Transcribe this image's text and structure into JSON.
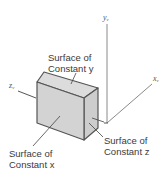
{
  "figure": {
    "axes": {
      "y": {
        "letter": "y",
        "sub": "v"
      },
      "x": {
        "letter": "x",
        "sub": "v"
      },
      "z": {
        "letter": "z",
        "sub": "v"
      }
    },
    "labels": {
      "constant_y": {
        "line1": "Surface of",
        "line2": "Constant y"
      },
      "constant_x": {
        "line1": "Surface of",
        "line2": "Constant x"
      },
      "constant_z": {
        "line1": "Surface of",
        "line2": "Constant z"
      }
    },
    "colors": {
      "box_front": "#d4d4d4",
      "box_top": "#dcdcdc",
      "box_side": "#cfcfcf",
      "edge": "#555555",
      "axis": "#777777",
      "text": "#3a3a3a"
    }
  }
}
